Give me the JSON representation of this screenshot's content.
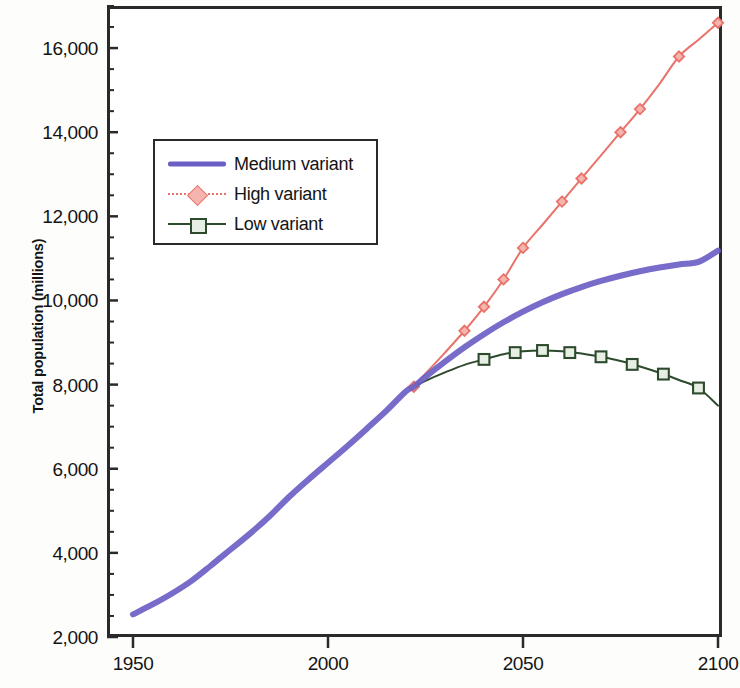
{
  "chart_data": {
    "type": "line",
    "title": "",
    "xlabel": "",
    "ylabel": "Total population (millions)",
    "xlim": [
      1950,
      2100
    ],
    "ylim": [
      2000,
      17000
    ],
    "xticks": [
      1950,
      2000,
      2050,
      2100
    ],
    "yticks": [
      2000,
      4000,
      6000,
      8000,
      10000,
      12000,
      14000,
      16000
    ],
    "ytick_labels": [
      "2,000",
      "4,000",
      "6,000",
      "8,000",
      "10,000",
      "12,000",
      "14,000",
      "16,000"
    ],
    "xtick_labels": [
      "1950",
      "2000",
      "2050",
      "2100"
    ],
    "minor_ytick_step": 500,
    "grid": false,
    "legend_position": "upper left",
    "series": [
      {
        "name": "Medium variant",
        "color": "#6b5fc4",
        "line_width": 6,
        "marker": "none",
        "x": [
          1950,
          1955,
          1960,
          1965,
          1970,
          1975,
          1980,
          1985,
          1990,
          1995,
          2000,
          2005,
          2010,
          2015,
          2020,
          2022,
          2025,
          2030,
          2035,
          2040,
          2045,
          2050,
          2055,
          2060,
          2065,
          2070,
          2075,
          2080,
          2085,
          2090,
          2095,
          2100
        ],
        "values": [
          2536,
          2773,
          3035,
          3335,
          3700,
          4079,
          4458,
          4870,
          5327,
          5744,
          6143,
          6542,
          6957,
          7380,
          7841,
          7950,
          8184,
          8546,
          8888,
          9199,
          9482,
          9735,
          9958,
          10151,
          10319,
          10464,
          10588,
          10694,
          10783,
          10857,
          10916,
          11184
        ]
      },
      {
        "name": "High variant",
        "color": "#e8736a",
        "line_width": 2,
        "marker": "diamond",
        "x": [
          2022,
          2025,
          2030,
          2035,
          2040,
          2045,
          2050,
          2055,
          2060,
          2065,
          2070,
          2075,
          2080,
          2085,
          2090,
          2095,
          2100
        ],
        "values": [
          7950,
          8260,
          8760,
          9280,
          9850,
          10500,
          11250,
          11800,
          12350,
          12900,
          13450,
          14000,
          14550,
          15150,
          15800,
          16200,
          16600
        ],
        "marker_x": [
          2022,
          2035,
          2040,
          2045,
          2050,
          2060,
          2065,
          2075,
          2080,
          2090,
          2100
        ],
        "marker_values": [
          7950,
          9280,
          9850,
          10500,
          11250,
          12350,
          12900,
          14000,
          14550,
          15800,
          16600
        ]
      },
      {
        "name": "Low variant",
        "color": "#2d4a2d",
        "line_width": 2,
        "marker": "square",
        "x": [
          2022,
          2025,
          2030,
          2035,
          2040,
          2045,
          2050,
          2055,
          2060,
          2065,
          2070,
          2075,
          2080,
          2085,
          2090,
          2095,
          2100
        ],
        "values": [
          7950,
          8090,
          8290,
          8470,
          8600,
          8720,
          8790,
          8810,
          8790,
          8740,
          8660,
          8560,
          8430,
          8280,
          8110,
          7920,
          7500
        ],
        "marker_x": [
          2040,
          2048,
          2055,
          2062,
          2070,
          2078,
          2086,
          2095
        ],
        "marker_values": [
          8600,
          8760,
          8810,
          8760,
          8660,
          8480,
          8250,
          7920
        ]
      }
    ]
  },
  "legend": {
    "items": [
      {
        "label": "Medium variant",
        "marker": "line",
        "color": "#6b5fc4"
      },
      {
        "label": "High variant",
        "marker": "diamond",
        "color": "#e8736a"
      },
      {
        "label": "Low variant",
        "marker": "square",
        "color": "#2d4a2d"
      }
    ]
  }
}
